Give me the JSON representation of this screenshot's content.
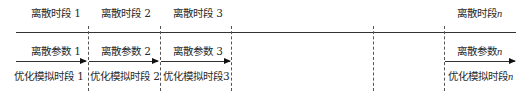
{
  "diagram": {
    "periods": [
      {
        "label": "离散时段 1",
        "param": "离散参数 1",
        "sim": "优化模拟时段 1"
      },
      {
        "label": "离散时段 2",
        "param": "离散参数 2",
        "sim": "优化模拟时段 2"
      },
      {
        "label": "离散时段 3",
        "param": "离散参数 3",
        "sim": "优化模拟时段3"
      },
      {
        "label_prefix": "离散时段",
        "param_prefix": "离散参数",
        "sim_prefix": "优化模拟时段",
        "index": "n"
      }
    ],
    "colors": {
      "line": "#333333",
      "dash": "#555555",
      "text": "#2a2a2a"
    }
  }
}
